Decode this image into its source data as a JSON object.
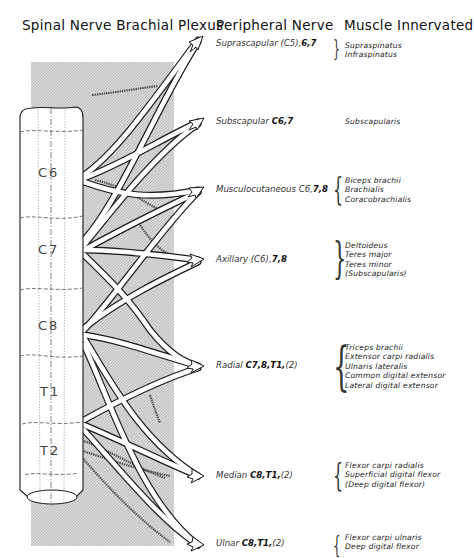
{
  "headers": {
    "spinal": "Spinal Nerve Brachial Plexus",
    "peripheral": "Peripheral Nerve",
    "muscle": "Muscle Innervated"
  },
  "segments": [
    "C6",
    "C7",
    "C8",
    "T1",
    "T2"
  ],
  "nerves": [
    {
      "name": "Suprascapular",
      "roots_plain": "(C5),",
      "roots_bold": "6,7",
      "roots_tail": "",
      "muscles": [
        "Supraspinatus",
        "Infraspinatus"
      ]
    },
    {
      "name": "Subscapular",
      "roots_plain": "",
      "roots_bold": "C6,7",
      "roots_tail": "",
      "muscles": [
        "Subscapularis"
      ]
    },
    {
      "name": "Musculocutaneous",
      "roots_plain": "C6,",
      "roots_bold": "7,8",
      "roots_tail": "",
      "muscles": [
        "Biceps brachii",
        "Brachialis",
        "Coracobrachialis"
      ]
    },
    {
      "name": "Axillary",
      "roots_plain": "(C6),",
      "roots_bold": "7,8",
      "roots_tail": "",
      "muscles": [
        "Deltoideus",
        "Teres major",
        "Teres minor",
        "(Subscapularis)"
      ]
    },
    {
      "name": "Radial",
      "roots_plain": "",
      "roots_bold": "C7,8,T1,",
      "roots_tail": "(2)",
      "muscles": [
        "Triceps brachii",
        "Extensor carpi radialis",
        "Ulnaris lateralis",
        "Common digital extensor",
        "Lateral digital extensor"
      ]
    },
    {
      "name": "Median",
      "roots_plain": "",
      "roots_bold": "C8,T1,",
      "roots_tail": "(2)",
      "muscles": [
        "Flexor carpi radialis",
        "Superficial digital flexor",
        "(Deep digital flexor)"
      ]
    },
    {
      "name": "Ulnar",
      "roots_plain": "",
      "roots_bold": "C8,T1,",
      "roots_tail": "(2)",
      "muscles": [
        "Flexor carpi ulnaris",
        "Deep digital flexor"
      ]
    }
  ],
  "colors": {
    "shade": "#cfcfcf",
    "line": "#222222",
    "text": "#333333"
  }
}
